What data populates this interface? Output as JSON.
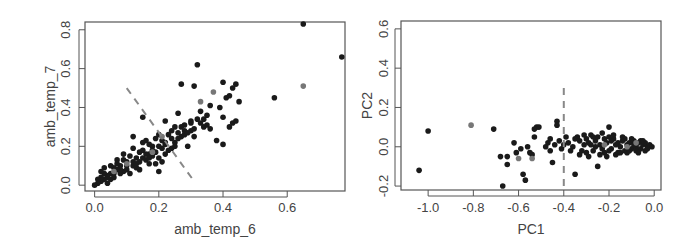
{
  "chart_data": [
    {
      "type": "scatter",
      "title": "",
      "xlabel": "amb_temp_6",
      "ylabel": "amb_temp_7",
      "xlim": [
        -0.03,
        0.78
      ],
      "ylim": [
        -0.03,
        0.84
      ],
      "xticks": [
        "0.0",
        "0.2",
        "0.4",
        "0.6"
      ],
      "xtick_values": [
        0.0,
        0.2,
        0.4,
        0.6
      ],
      "yticks": [
        "0.0",
        "0.2",
        "0.4",
        "0.6",
        "0.8"
      ],
      "ytick_values": [
        0.0,
        0.2,
        0.4,
        0.6,
        0.8
      ],
      "grid": false,
      "reference_line": {
        "style": "dashed",
        "color": "#888888",
        "x": [
          0.1,
          0.31
        ],
        "y": [
          0.5,
          0.02
        ]
      },
      "highlight_color": "#777777",
      "point_color": "#1a1a1a",
      "points_dark": [
        [
          0.65,
          0.83
        ],
        [
          0.77,
          0.66
        ],
        [
          0.56,
          0.45
        ],
        [
          0.32,
          0.62
        ],
        [
          0.27,
          0.52
        ],
        [
          0.31,
          0.51
        ],
        [
          0.4,
          0.53
        ],
        [
          0.44,
          0.52
        ],
        [
          0.43,
          0.5
        ],
        [
          0.42,
          0.46
        ],
        [
          0.45,
          0.43
        ],
        [
          0.41,
          0.45
        ],
        [
          0.4,
          0.35
        ],
        [
          0.39,
          0.4
        ],
        [
          0.43,
          0.32
        ],
        [
          0.42,
          0.3
        ],
        [
          0.44,
          0.33
        ],
        [
          0.38,
          0.23
        ],
        [
          0.4,
          0.21
        ],
        [
          0.36,
          0.41
        ],
        [
          0.35,
          0.36
        ],
        [
          0.33,
          0.38
        ],
        [
          0.34,
          0.3
        ],
        [
          0.3,
          0.32
        ],
        [
          0.28,
          0.28
        ],
        [
          0.26,
          0.37
        ],
        [
          0.25,
          0.3
        ],
        [
          0.22,
          0.33
        ],
        [
          0.15,
          0.35
        ],
        [
          0.2,
          0.07
        ],
        [
          0.19,
          0.24
        ],
        [
          0.14,
          0.17
        ],
        [
          0.12,
          0.25
        ],
        [
          0.18,
          0.2
        ],
        [
          0.17,
          0.16
        ],
        [
          0.22,
          0.22
        ],
        [
          0.24,
          0.19
        ],
        [
          0.27,
          0.25
        ],
        [
          0.29,
          0.2
        ],
        [
          0.31,
          0.29
        ],
        [
          0.16,
          0.23
        ],
        [
          0.13,
          0.14
        ],
        [
          0.1,
          0.12
        ],
        [
          0.08,
          0.1
        ],
        [
          0.07,
          0.08
        ],
        [
          0.05,
          0.06
        ],
        [
          0.04,
          0.05
        ],
        [
          0.03,
          0.03
        ],
        [
          0.02,
          0.02
        ],
        [
          0.01,
          0.01
        ],
        [
          0.0,
          0.0
        ],
        [
          0.06,
          0.09
        ],
        [
          0.09,
          0.13
        ],
        [
          0.11,
          0.15
        ],
        [
          0.12,
          0.1
        ],
        [
          0.14,
          0.12
        ],
        [
          0.15,
          0.18
        ],
        [
          0.17,
          0.21
        ],
        [
          0.19,
          0.17
        ],
        [
          0.21,
          0.19
        ],
        [
          0.23,
          0.26
        ],
        [
          0.25,
          0.22
        ],
        [
          0.09,
          0.07
        ],
        [
          0.07,
          0.11
        ],
        [
          0.05,
          0.03
        ],
        [
          0.03,
          0.06
        ],
        [
          0.02,
          0.04
        ],
        [
          0.04,
          0.01
        ],
        [
          0.06,
          0.04
        ],
        [
          0.08,
          0.06
        ],
        [
          0.1,
          0.08
        ],
        [
          0.13,
          0.09
        ],
        [
          0.16,
          0.13
        ],
        [
          0.18,
          0.15
        ],
        [
          0.2,
          0.14
        ],
        [
          0.22,
          0.16
        ],
        [
          0.24,
          0.24
        ],
        [
          0.26,
          0.27
        ],
        [
          0.28,
          0.31
        ],
        [
          0.3,
          0.33
        ],
        [
          0.32,
          0.34
        ],
        [
          0.33,
          0.32
        ],
        [
          0.35,
          0.31
        ],
        [
          0.36,
          0.29
        ],
        [
          0.11,
          0.06
        ],
        [
          0.14,
          0.08
        ],
        [
          0.17,
          0.11
        ],
        [
          0.19,
          0.11
        ],
        [
          0.21,
          0.12
        ],
        [
          0.01,
          0.03
        ],
        [
          0.02,
          0.07
        ],
        [
          0.03,
          0.09
        ],
        [
          0.05,
          0.1
        ],
        [
          0.07,
          0.13
        ],
        [
          0.09,
          0.16
        ],
        [
          0.12,
          0.19
        ],
        [
          0.15,
          0.22
        ],
        [
          0.2,
          0.26
        ],
        [
          0.24,
          0.28
        ],
        [
          0.12,
          0.12
        ],
        [
          0.1,
          0.1
        ],
        [
          0.08,
          0.08
        ],
        [
          0.06,
          0.06
        ],
        [
          0.04,
          0.04
        ],
        [
          0.16,
          0.16
        ],
        [
          0.18,
          0.18
        ],
        [
          0.2,
          0.2
        ],
        [
          0.22,
          0.21
        ],
        [
          0.26,
          0.24
        ],
        [
          0.28,
          0.26
        ],
        [
          0.3,
          0.28
        ],
        [
          0.34,
          0.34
        ],
        [
          0.13,
          0.11
        ],
        [
          0.15,
          0.14
        ],
        [
          0.17,
          0.14
        ],
        [
          0.27,
          0.3
        ],
        [
          0.29,
          0.27
        ],
        [
          0.31,
          0.25
        ],
        [
          0.23,
          0.18
        ],
        [
          0.25,
          0.2
        ],
        [
          0.21,
          0.23
        ]
      ],
      "points_highlight": [
        [
          0.65,
          0.51
        ],
        [
          0.37,
          0.48
        ],
        [
          0.33,
          0.43
        ],
        [
          0.21,
          0.25
        ],
        [
          0.18,
          0.17
        ],
        [
          0.1,
          0.11
        ],
        [
          0.06,
          0.07
        ]
      ]
    },
    {
      "type": "scatter",
      "title": "",
      "xlabel": "PC1",
      "ylabel": "PC2",
      "xlim": [
        -1.12,
        0.03
      ],
      "ylim": [
        -0.22,
        0.64
      ],
      "xticks": [
        "-1.0",
        "-0.8",
        "-0.6",
        "-0.4",
        "-0.2",
        "0.0"
      ],
      "xtick_values": [
        -1.0,
        -0.8,
        -0.6,
        -0.4,
        -0.2,
        0.0
      ],
      "yticks": [
        "-0.2",
        "0.0",
        "0.2",
        "0.4",
        "0.6"
      ],
      "ytick_values": [
        -0.2,
        0.0,
        0.2,
        0.4,
        0.6
      ],
      "grid": false,
      "reference_line": {
        "style": "dashed",
        "color": "#888888",
        "x": [
          -0.4,
          -0.4
        ],
        "y": [
          -0.2,
          0.3
        ]
      },
      "highlight_color": "#777777",
      "point_color": "#1a1a1a",
      "points_dark": [
        [
          -1.04,
          -0.12
        ],
        [
          -1.0,
          0.08
        ],
        [
          -0.71,
          0.09
        ],
        [
          -0.67,
          -0.2
        ],
        [
          -0.68,
          -0.05
        ],
        [
          -0.65,
          -0.05
        ],
        [
          -0.65,
          -0.09
        ],
        [
          -0.62,
          0.02
        ],
        [
          -0.61,
          -0.03
        ],
        [
          -0.59,
          -0.01
        ],
        [
          -0.58,
          -0.14
        ],
        [
          -0.57,
          -0.17
        ],
        [
          -0.56,
          -0.0
        ],
        [
          -0.55,
          -0.03
        ],
        [
          -0.54,
          -0.04
        ],
        [
          -0.53,
          0.09
        ],
        [
          -0.52,
          0.1
        ],
        [
          -0.51,
          0.1
        ],
        [
          -0.53,
          0.05
        ],
        [
          -0.48,
          0.0
        ],
        [
          -0.47,
          0.02
        ],
        [
          -0.46,
          0.04
        ],
        [
          -0.45,
          -0.08
        ],
        [
          -0.44,
          0.01
        ],
        [
          -0.43,
          0.13
        ],
        [
          -0.43,
          0.11
        ],
        [
          -0.42,
          0.03
        ],
        [
          -0.41,
          -0.01
        ],
        [
          -0.39,
          0.05
        ],
        [
          -0.38,
          0.02
        ],
        [
          -0.36,
          0.0
        ],
        [
          -0.35,
          -0.14
        ],
        [
          -0.34,
          0.05
        ],
        [
          -0.33,
          0.03
        ],
        [
          -0.32,
          -0.02
        ],
        [
          -0.31,
          0.01
        ],
        [
          -0.3,
          0.04
        ],
        [
          -0.29,
          -0.05
        ],
        [
          -0.28,
          0.06
        ],
        [
          -0.27,
          -0.02
        ],
        [
          -0.26,
          0.03
        ],
        [
          -0.25,
          -0.1
        ],
        [
          -0.24,
          0.01
        ],
        [
          -0.23,
          0.07
        ],
        [
          -0.22,
          -0.03
        ],
        [
          -0.21,
          0.02
        ],
        [
          -0.2,
          0.1
        ],
        [
          -0.19,
          -0.01
        ],
        [
          -0.18,
          0.04
        ],
        [
          -0.17,
          -0.04
        ],
        [
          -0.16,
          0.02
        ],
        [
          -0.15,
          0.0
        ],
        [
          -0.14,
          0.03
        ],
        [
          -0.13,
          -0.02
        ],
        [
          -0.12,
          0.01
        ],
        [
          -0.11,
          0.02
        ],
        [
          -0.1,
          -0.01
        ],
        [
          -0.09,
          0.03
        ],
        [
          -0.08,
          0.0
        ],
        [
          -0.07,
          0.02
        ],
        [
          -0.06,
          -0.01
        ],
        [
          -0.05,
          0.01
        ],
        [
          -0.04,
          0.02
        ],
        [
          -0.03,
          0.0
        ],
        [
          -0.02,
          0.01
        ],
        [
          -0.01,
          0.0
        ],
        [
          -0.35,
          0.04
        ],
        [
          -0.3,
          -0.03
        ],
        [
          -0.28,
          0.01
        ],
        [
          -0.25,
          0.05
        ],
        [
          -0.22,
          0.04
        ],
        [
          -0.2,
          -0.02
        ],
        [
          -0.18,
          0.06
        ],
        [
          -0.16,
          -0.03
        ],
        [
          -0.14,
          0.05
        ],
        [
          -0.12,
          -0.03
        ],
        [
          -0.1,
          0.04
        ],
        [
          -0.08,
          -0.02
        ],
        [
          -0.06,
          0.03
        ],
        [
          -0.04,
          -0.02
        ],
        [
          -0.33,
          -0.04
        ],
        [
          -0.31,
          0.06
        ],
        [
          -0.29,
          0.02
        ],
        [
          -0.27,
          0.05
        ],
        [
          -0.24,
          -0.04
        ],
        [
          -0.21,
          -0.05
        ],
        [
          -0.19,
          0.03
        ],
        [
          -0.17,
          0.01
        ],
        [
          -0.15,
          -0.03
        ],
        [
          -0.13,
          0.04
        ],
        [
          -0.11,
          -0.02
        ],
        [
          -0.09,
          0.01
        ],
        [
          -0.07,
          -0.03
        ],
        [
          -0.05,
          0.03
        ],
        [
          -0.03,
          -0.01
        ],
        [
          -0.26,
          0.0
        ],
        [
          -0.23,
          -0.01
        ],
        [
          -0.2,
          0.05
        ],
        [
          -0.37,
          -0.02
        ],
        [
          -0.4,
          0.01
        ],
        [
          -0.46,
          -0.02
        ]
      ],
      "points_highlight": [
        [
          -0.81,
          0.11
        ],
        [
          -0.6,
          -0.06
        ],
        [
          -0.54,
          -0.06
        ],
        [
          -0.22,
          0.01
        ],
        [
          -0.12,
          0.0
        ],
        [
          -0.08,
          0.02
        ]
      ]
    }
  ]
}
